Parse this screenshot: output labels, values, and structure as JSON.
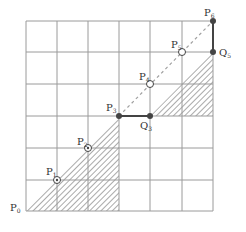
{
  "diagram": {
    "type": "grid-path",
    "grid": {
      "cols": 6,
      "rows": 6,
      "x0": 26,
      "y0": 21,
      "cell": 31.2,
      "line_color": "#9a9a9a"
    },
    "colors": {
      "line": "#9a9a9a",
      "path": "#444444",
      "hatch": "#555555",
      "diagonal": "#a0a0a0",
      "dot": "#444444"
    },
    "points": [
      {
        "id": "P0",
        "base": "P",
        "sub": "0",
        "x": 26,
        "y": 211,
        "style": "none",
        "lx": 10,
        "ly": 211
      },
      {
        "id": "P1",
        "base": "P",
        "sub": "1",
        "x": 57,
        "y": 180,
        "style": "circled-dot",
        "lx": 46,
        "ly": 175
      },
      {
        "id": "P2",
        "base": "P",
        "sub": "2",
        "x": 88,
        "y": 148,
        "style": "circled-dot",
        "lx": 77,
        "ly": 145
      },
      {
        "id": "P3",
        "base": "P",
        "sub": "3",
        "x": 119,
        "y": 116,
        "style": "filled",
        "lx": 106,
        "ly": 111
      },
      {
        "id": "Q3",
        "base": "Q",
        "sub": "3",
        "x": 150,
        "y": 116,
        "style": "filled",
        "lx": 140,
        "ly": 129
      },
      {
        "id": "P4",
        "base": "P",
        "sub": "4",
        "x": 150,
        "y": 84,
        "style": "open",
        "lx": 139,
        "ly": 80
      },
      {
        "id": "P5",
        "base": "P",
        "sub": "5",
        "x": 182,
        "y": 52,
        "style": "open",
        "lx": 171,
        "ly": 48
      },
      {
        "id": "Q5",
        "base": "Q",
        "sub": "5",
        "x": 213,
        "y": 52,
        "style": "filled",
        "lx": 219,
        "ly": 56
      },
      {
        "id": "P6",
        "base": "P",
        "sub": "6",
        "x": 213,
        "y": 21,
        "style": "filled",
        "lx": 204,
        "ly": 16
      }
    ],
    "shaded_regions": [
      {
        "name": "lower-left-triangle",
        "vertices": [
          [
            26,
            211
          ],
          [
            119,
            116
          ],
          [
            119,
            211
          ]
        ]
      },
      {
        "name": "right-triangle",
        "vertices": [
          [
            150,
            116
          ],
          [
            213,
            52
          ],
          [
            213,
            116
          ]
        ]
      }
    ],
    "segments": [
      {
        "from": "P3",
        "to": "Q3"
      },
      {
        "from": "Q5",
        "to": "P6"
      }
    ],
    "dashed_diagonal": {
      "from": [
        119,
        116
      ],
      "to": [
        213,
        21
      ]
    }
  }
}
